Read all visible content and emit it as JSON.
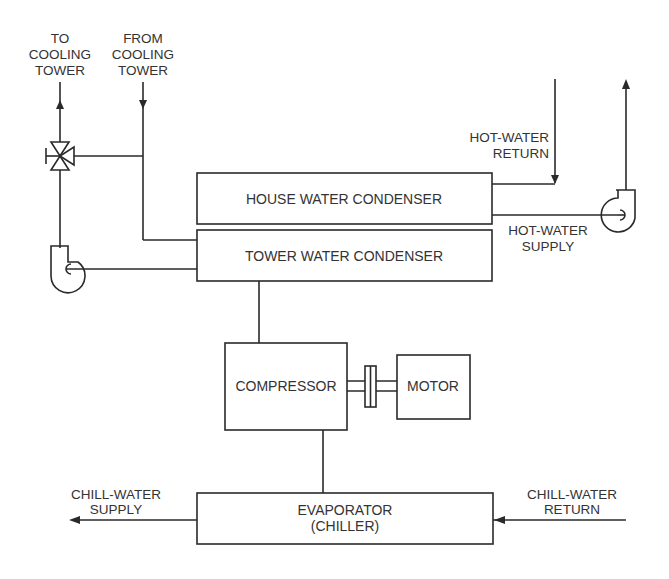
{
  "diagram": {
    "components": {
      "house_condenser": "HOUSE WATER CONDENSER",
      "tower_condenser": "TOWER WATER CONDENSER",
      "compressor": "COMPRESSOR",
      "motor": "MOTOR",
      "evaporator_line1": "EVAPORATOR",
      "evaporator_line2": "(CHILLER)"
    },
    "flows": {
      "to_cooling_tower": [
        "TO",
        "COOLING",
        "TOWER"
      ],
      "from_cooling_tower": [
        "FROM",
        "COOLING",
        "TOWER"
      ],
      "hot_water_return": [
        "HOT-WATER",
        "RETURN"
      ],
      "hot_water_supply": [
        "HOT-WATER",
        "SUPPLY"
      ],
      "chill_water_supply": [
        "CHILL-WATER",
        "SUPPLY"
      ],
      "chill_water_return": [
        "CHILL-WATER",
        "RETURN"
      ]
    },
    "symbols": [
      "three-way-valve",
      "tower-water-pump",
      "hot-water-pump",
      "shaft-coupling"
    ],
    "colors": {
      "line": "#2a2a2a",
      "text": "#333333",
      "background": "#ffffff"
    }
  }
}
